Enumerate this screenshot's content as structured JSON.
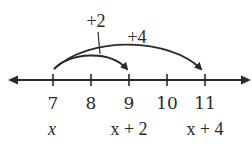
{
  "diagram": {
    "type": "number-line",
    "axis": {
      "min_visible": 7,
      "max_visible": 11,
      "arrows_both_ends": true
    },
    "ticks": [
      {
        "value": "7",
        "variable": "x"
      },
      {
        "value": "8",
        "variable": ""
      },
      {
        "value": "9",
        "variable": "x + 2"
      },
      {
        "value": "10",
        "variable": ""
      },
      {
        "value": "11",
        "variable": "x + 4"
      }
    ],
    "jumps": [
      {
        "label": "+2",
        "from": "7",
        "to": "9"
      },
      {
        "label": "+4",
        "from": "7",
        "to": "11"
      }
    ],
    "colors": {
      "ink": "#2a2a2a",
      "background": "#ffffff"
    }
  }
}
